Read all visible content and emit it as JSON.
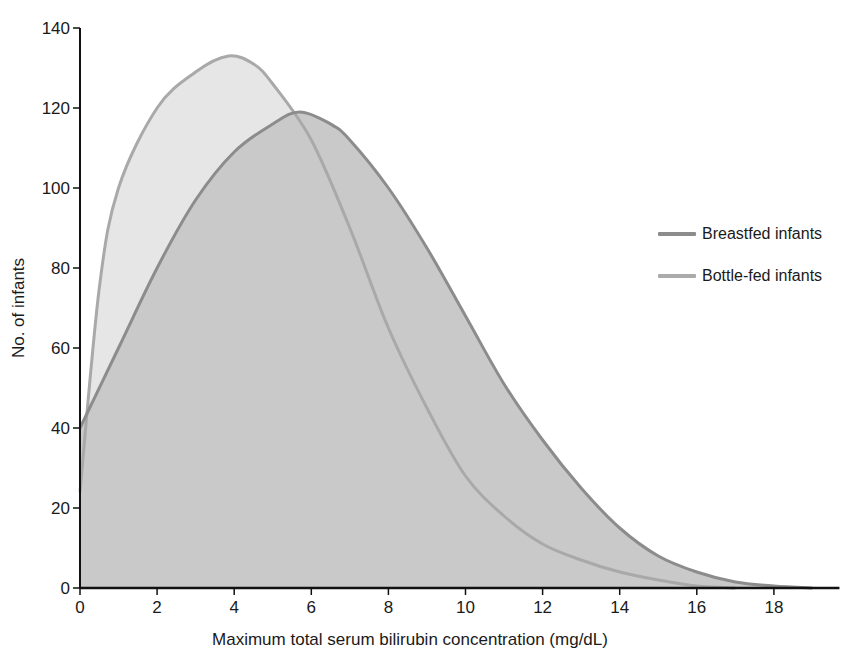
{
  "chart_data": {
    "type": "area",
    "title": "",
    "xlabel": "Maximum total serum bilirubin concentration (mg/dL)",
    "ylabel": "No. of infants",
    "xlim": [
      0,
      20
    ],
    "ylim": [
      0,
      140
    ],
    "x_ticks": [
      0,
      2,
      4,
      6,
      8,
      10,
      12,
      14,
      16,
      18
    ],
    "y_ticks": [
      0,
      20,
      40,
      60,
      80,
      100,
      120,
      140
    ],
    "grid": false,
    "legend_position": "right",
    "series": [
      {
        "name": "Breastfed infants",
        "line_color": "#8c8c8c",
        "fill_color": "#c9c9c9",
        "x": [
          0,
          1,
          2,
          3,
          4,
          5,
          5.7,
          6.5,
          7,
          8,
          9,
          10,
          11,
          12,
          13,
          14,
          15,
          16,
          17,
          18,
          19
        ],
        "y": [
          40,
          60,
          80,
          97,
          109,
          116,
          119,
          116,
          112,
          100,
          85,
          68,
          51,
          37,
          25,
          15,
          8,
          4,
          1.5,
          0.5,
          0
        ],
        "peak": {
          "x": 5.7,
          "y": 119
        }
      },
      {
        "name": "Bottle-fed infants",
        "line_color": "#a9a9a9",
        "fill_color": "#e6e6e6",
        "x": [
          0,
          0.5,
          1,
          2,
          3,
          3.85,
          4.5,
          5,
          6,
          7,
          8,
          9,
          10,
          11,
          12,
          13,
          14,
          15,
          16,
          17
        ],
        "y": [
          24,
          75,
          100,
          120,
          129,
          133,
          131,
          126,
          112,
          90,
          65,
          45,
          28,
          18,
          11,
          7,
          4,
          2,
          0.5,
          0
        ],
        "peak": {
          "x": 3.85,
          "y": 133
        }
      }
    ]
  },
  "axes": {
    "xlabel": "Maximum total serum bilirubin concentration (mg/dL)",
    "ylabel": "No. of infants"
  },
  "legend": {
    "items": [
      {
        "label": "Breastfed infants",
        "color": "#8c8c8c"
      },
      {
        "label": "Bottle-fed infants",
        "color": "#ababab"
      }
    ]
  }
}
